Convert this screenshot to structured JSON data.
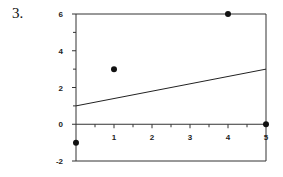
{
  "problem_number": "3.",
  "chart_data": {
    "type": "scatter",
    "title": "",
    "xlabel": "",
    "ylabel": "",
    "xlim": [
      0,
      5
    ],
    "ylim": [
      -2,
      6
    ],
    "grid": false,
    "x_ticks": [
      1,
      2,
      3,
      4,
      5
    ],
    "x_minor_step": 0.5,
    "y_ticks": [
      -2,
      0,
      2,
      4,
      6
    ],
    "y_minor_step": 1,
    "series": [
      {
        "name": "data points",
        "type": "scatter",
        "x": [
          0,
          1,
          4,
          5
        ],
        "y": [
          -1,
          3,
          6,
          0
        ]
      },
      {
        "name": "fitted line",
        "type": "line",
        "x": [
          0,
          5
        ],
        "y": [
          1,
          3
        ],
        "slope": 0.4,
        "intercept": 1
      }
    ]
  }
}
